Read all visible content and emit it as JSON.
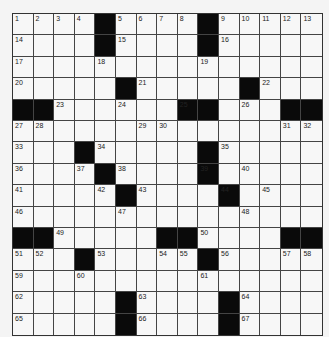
{
  "puzzle": {
    "rows": 15,
    "cols": 15,
    "colors": {
      "black": "#0a0a0a",
      "white": "#f7f7f7",
      "line": "#444444"
    },
    "layout": [
      "....#....#.....",
      "....#....#.....",
      "...............",
      ".....#.....#...",
      "##......##...##",
      "...............",
      "...#.....#.....",
      "....#....#.....",
      ".....#....#....",
      "...............",
      "##.....##....##",
      "...#.....#.....",
      "...............",
      ".....#....#....",
      ".....#....#...."
    ],
    "numbers": [
      {
        "r": 0,
        "c": 0,
        "n": "1"
      },
      {
        "r": 0,
        "c": 1,
        "n": "2"
      },
      {
        "r": 0,
        "c": 2,
        "n": "3"
      },
      {
        "r": 0,
        "c": 3,
        "n": "4"
      },
      {
        "r": 0,
        "c": 5,
        "n": "5"
      },
      {
        "r": 0,
        "c": 6,
        "n": "6"
      },
      {
        "r": 0,
        "c": 7,
        "n": "7"
      },
      {
        "r": 0,
        "c": 8,
        "n": "8"
      },
      {
        "r": 0,
        "c": 10,
        "n": "9"
      },
      {
        "r": 0,
        "c": 11,
        "n": "10"
      },
      {
        "r": 0,
        "c": 12,
        "n": "11"
      },
      {
        "r": 0,
        "c": 13,
        "n": "12"
      },
      {
        "r": 0,
        "c": 14,
        "n": "13"
      },
      {
        "r": 1,
        "c": 0,
        "n": "14"
      },
      {
        "r": 1,
        "c": 5,
        "n": "15"
      },
      {
        "r": 1,
        "c": 10,
        "n": "16"
      },
      {
        "r": 2,
        "c": 0,
        "n": "17"
      },
      {
        "r": 2,
        "c": 4,
        "n": "18"
      },
      {
        "r": 2,
        "c": 9,
        "n": "19"
      },
      {
        "r": 3,
        "c": 0,
        "n": "20"
      },
      {
        "r": 3,
        "c": 6,
        "n": "21"
      },
      {
        "r": 3,
        "c": 12,
        "n": "22"
      },
      {
        "r": 4,
        "c": 2,
        "n": "23"
      },
      {
        "r": 4,
        "c": 5,
        "n": "24"
      },
      {
        "r": 4,
        "c": 8,
        "n": "25"
      },
      {
        "r": 4,
        "c": 11,
        "n": "26"
      },
      {
        "r": 5,
        "c": 0,
        "n": "27"
      },
      {
        "r": 5,
        "c": 1,
        "n": "28"
      },
      {
        "r": 5,
        "c": 6,
        "n": "29"
      },
      {
        "r": 5,
        "c": 7,
        "n": "30"
      },
      {
        "r": 5,
        "c": 13,
        "n": "31"
      },
      {
        "r": 5,
        "c": 14,
        "n": "32"
      },
      {
        "r": 6,
        "c": 0,
        "n": "33"
      },
      {
        "r": 6,
        "c": 4,
        "n": "34"
      },
      {
        "r": 6,
        "c": 10,
        "n": "35"
      },
      {
        "r": 7,
        "c": 0,
        "n": "36"
      },
      {
        "r": 7,
        "c": 3,
        "n": "37"
      },
      {
        "r": 7,
        "c": 5,
        "n": "38"
      },
      {
        "r": 7,
        "c": 9,
        "n": "39"
      },
      {
        "r": 7,
        "c": 11,
        "n": "40"
      },
      {
        "r": 8,
        "c": 0,
        "n": "41"
      },
      {
        "r": 8,
        "c": 4,
        "n": "42"
      },
      {
        "r": 8,
        "c": 6,
        "n": "43"
      },
      {
        "r": 8,
        "c": 10,
        "n": "44"
      },
      {
        "r": 8,
        "c": 12,
        "n": "45"
      },
      {
        "r": 9,
        "c": 0,
        "n": "46"
      },
      {
        "r": 9,
        "c": 5,
        "n": "47"
      },
      {
        "r": 9,
        "c": 11,
        "n": "48"
      },
      {
        "r": 10,
        "c": 2,
        "n": "49"
      },
      {
        "r": 10,
        "c": 9,
        "n": "50"
      },
      {
        "r": 11,
        "c": 0,
        "n": "51"
      },
      {
        "r": 11,
        "c": 1,
        "n": "52"
      },
      {
        "r": 11,
        "c": 4,
        "n": "53"
      },
      {
        "r": 11,
        "c": 7,
        "n": "54"
      },
      {
        "r": 11,
        "c": 8,
        "n": "55"
      },
      {
        "r": 11,
        "c": 10,
        "n": "56"
      },
      {
        "r": 11,
        "c": 13,
        "n": "57"
      },
      {
        "r": 11,
        "c": 14,
        "n": "58"
      },
      {
        "r": 12,
        "c": 0,
        "n": "59"
      },
      {
        "r": 12,
        "c": 3,
        "n": "60"
      },
      {
        "r": 12,
        "c": 9,
        "n": "61"
      },
      {
        "r": 13,
        "c": 0,
        "n": "62"
      },
      {
        "r": 13,
        "c": 6,
        "n": "63"
      },
      {
        "r": 13,
        "c": 11,
        "n": "64"
      },
      {
        "r": 14,
        "c": 0,
        "n": "65"
      },
      {
        "r": 14,
        "c": 6,
        "n": "66"
      },
      {
        "r": 14,
        "c": 11,
        "n": "67"
      }
    ]
  }
}
